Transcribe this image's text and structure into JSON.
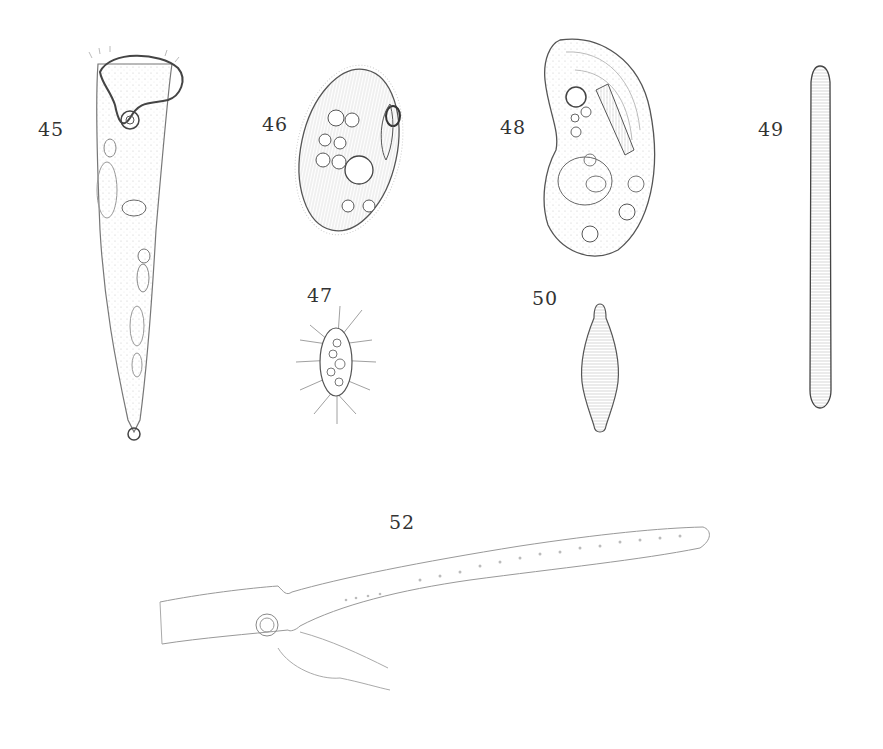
{
  "plate": {
    "figures": [
      {
        "number": "45",
        "label_pos": [
          38,
          118
        ]
      },
      {
        "number": "46",
        "label_pos": [
          262,
          113
        ]
      },
      {
        "number": "47",
        "label_pos": [
          307,
          284
        ]
      },
      {
        "number": "48",
        "label_pos": [
          500,
          116
        ]
      },
      {
        "number": "49",
        "label_pos": [
          758,
          118
        ]
      },
      {
        "number": "50",
        "label_pos": [
          532,
          287
        ]
      },
      {
        "number": "52",
        "label_pos": [
          389,
          511
        ]
      }
    ]
  },
  "colors": {
    "ink": "#3a3a3a",
    "light_ink": "#9a9a9a",
    "paper": "#ffffff"
  }
}
